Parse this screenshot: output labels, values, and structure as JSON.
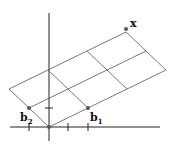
{
  "diagram": {
    "labels": {
      "x": "x",
      "b1": "b",
      "b1_sub": "1",
      "b2": "b",
      "b2_sub": "2"
    },
    "colors": {
      "line": "#444444",
      "axis": "#222222",
      "point": "#555555"
    }
  }
}
